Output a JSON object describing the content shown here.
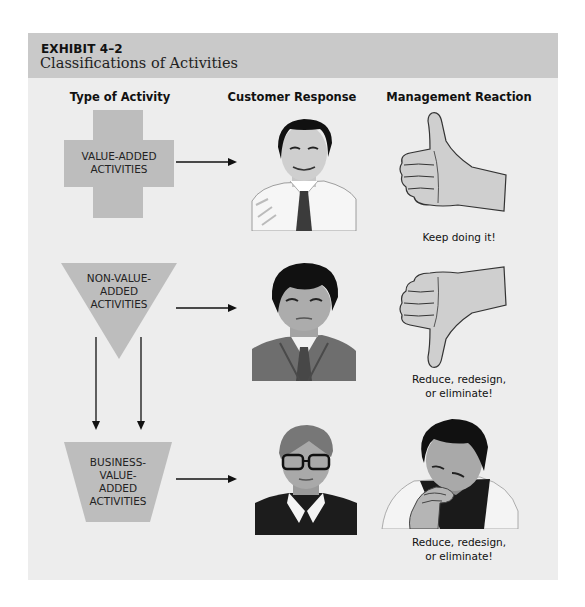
{
  "exhibit": {
    "number": "EXHIBIT 4–2",
    "title": "Classifications of Activities"
  },
  "columns": [
    {
      "label": "Type of Activity"
    },
    {
      "label": "Customer Response"
    },
    {
      "label": "Management Reaction"
    }
  ],
  "rows": [
    {
      "activity_shape": "plus-sign",
      "activity_label_lines": [
        "VALUE-ADDED",
        "ACTIVITIES"
      ],
      "customer_icon": "satisfied-man-in-tie-illustration",
      "management_icon": "thumbs-up-hand-illustration",
      "management_caption_lines": [
        "Keep doing it!"
      ]
    },
    {
      "activity_shape": "inverted-triangle",
      "activity_label_lines": [
        "NON-VALUE-",
        "ADDED",
        "ACTIVITIES"
      ],
      "customer_icon": "unhappy-man-in-suit-illustration",
      "management_icon": "thumbs-down-hand-illustration",
      "management_caption_lines": [
        "Reduce, redesign,",
        "or eliminate!"
      ]
    },
    {
      "activity_shape": "inverted-trapezoid",
      "activity_label_lines": [
        "BUSINESS-",
        "VALUE-",
        "ADDED",
        "ACTIVITIES"
      ],
      "customer_icon": "boy-with-glasses-illustration",
      "management_icon": "thinking-man-illustration",
      "management_caption_lines": [
        "Reduce, redesign,",
        "or eliminate!"
      ]
    }
  ],
  "colors": {
    "panel_background": "#ededed",
    "header_band": "#c9c9c9",
    "shape_fill": "#bdbdbd",
    "arrow": "#111111"
  }
}
